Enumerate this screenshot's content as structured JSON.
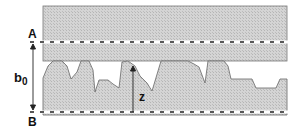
{
  "diagram": {
    "labels": {
      "top_line": "A",
      "bottom_line": "B",
      "gap": "b",
      "gap_subscript": "0",
      "height": "z"
    },
    "colors": {
      "fill": "#cfcfcf",
      "hatch": "#b8b8b8",
      "stroke": "#555555",
      "dash": "#222222"
    }
  }
}
